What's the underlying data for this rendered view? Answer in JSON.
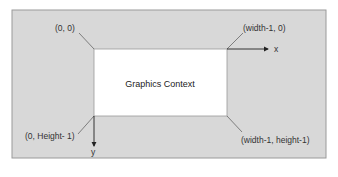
{
  "diagram": {
    "title": "Graphics Context",
    "corners": {
      "top_left": "(0, 0)",
      "top_right": "(width-1, 0)",
      "bottom_left": "(0, Height- 1)",
      "bottom_right": "(width-1, height-1)"
    },
    "axes": {
      "x": "x",
      "y": "y"
    },
    "colors": {
      "outer_fill": "#d8d8d8",
      "inner_fill": "#ffffff",
      "line": "#333333",
      "border": "#999999"
    }
  }
}
